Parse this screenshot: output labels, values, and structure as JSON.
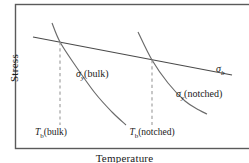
{
  "chart_data": {
    "type": "line",
    "title": "",
    "xlabel": "Temperature",
    "ylabel": "Stress",
    "grid": false,
    "legend": "inline-annotations",
    "axis_frame": "box",
    "axis_tick_labels": {
      "x": [
        "T_b(bulk)",
        "T_b(notched)"
      ],
      "y": []
    },
    "series": [
      {
        "name": "sigma_b",
        "label": "σb",
        "style": "solid",
        "color": "#4a4a4a",
        "description": "Brittle fracture stress, shallow downward straight line",
        "points": [
          [
            33,
            37
          ],
          [
            232,
            75
          ]
        ]
      },
      {
        "name": "sigma_y_bulk",
        "label": "σy(bulk)",
        "style": "solid",
        "color": "#6b6b6b",
        "description": "Yield stress of bulk material, steeply falling convex curve",
        "points": [
          [
            52,
            23
          ],
          [
            60,
            42
          ],
          [
            75,
            65
          ],
          [
            95,
            93
          ],
          [
            112,
            112
          ],
          [
            126,
            125
          ]
        ]
      },
      {
        "name": "sigma_y_notched",
        "label": "σy(notched)",
        "style": "solid",
        "color": "#6b6b6b",
        "description": "Yield stress of notched material, steeply falling convex curve shifted right",
        "points": [
          [
            138,
            32
          ],
          [
            152,
            60
          ],
          [
            168,
            83
          ],
          [
            185,
            101
          ],
          [
            199,
            110
          ],
          [
            207,
            114
          ]
        ]
      },
      {
        "name": "tb_bulk_marker",
        "label": "Tb(bulk)",
        "style": "dashed",
        "color": "#9a9a9a",
        "description": "Vertical dashed line at intersection of sigma_b and sigma_y(bulk)",
        "points": [
          [
            60,
            42
          ],
          [
            60,
            125
          ]
        ]
      },
      {
        "name": "tb_notched_marker",
        "label": "Tb(notched)",
        "style": "dashed",
        "color": "#9a9a9a",
        "description": "Vertical dashed line at intersection of sigma_b and sigma_y(notched)",
        "points": [
          [
            152,
            60
          ],
          [
            152,
            125
          ]
        ]
      }
    ],
    "annotations": [
      {
        "id": "sigma_b",
        "text": "σb",
        "x": 216,
        "y": 63
      },
      {
        "id": "sigma_y_bulk",
        "text": "σy(bulk)",
        "x": 76,
        "y": 68
      },
      {
        "id": "sigma_y_notched",
        "text": "σy(notched)",
        "x": 176,
        "y": 88
      }
    ],
    "colors": {
      "frame": "#5a5a5a",
      "curve": "#6b6b6b",
      "line": "#4a4a4a",
      "dashed": "#9a9a9a",
      "text": "#1a1a1a",
      "background": "#ffffff"
    }
  },
  "labels": {
    "ylabel": "Stress",
    "xlabel": "Temperature",
    "sigma_b": {
      "symbol": "σ",
      "sub": "b",
      "suffix": ""
    },
    "sigma_y_bulk": {
      "symbol": "σ",
      "sub": "y",
      "suffix": "(bulk)"
    },
    "sigma_y_notched": {
      "symbol": "σ",
      "sub": "y",
      "suffix": "(notched)"
    },
    "tb_bulk": {
      "symbol": "T",
      "sub": "b",
      "suffix": "(bulk)"
    },
    "tb_notched": {
      "symbol": "T",
      "sub": "b",
      "suffix": "(notched)"
    }
  }
}
